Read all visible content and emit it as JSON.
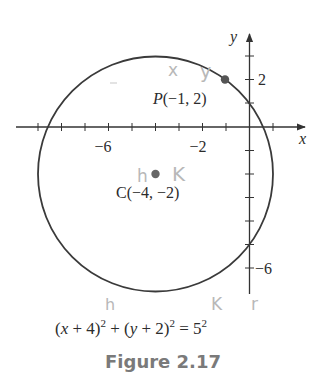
{
  "figure": {
    "caption": "Figure 2.17",
    "equation": {
      "part1": "(",
      "x": "x",
      "part2": " + 4)",
      "exp1": "2",
      "part3": " + (",
      "y": "y",
      "part4": " + 2)",
      "exp2": "2",
      "part5": " = 5",
      "exp3": "2"
    },
    "axes": {
      "x_label": "x",
      "y_label": "y",
      "x_tick_labels": [
        {
          "value": -6,
          "text": "−6"
        },
        {
          "value": -2,
          "text": "−2"
        }
      ],
      "y_tick_labels": [
        {
          "value": 2,
          "text": "2"
        },
        {
          "value": -6,
          "text": "−6"
        }
      ]
    },
    "points": {
      "P": {
        "name": "P",
        "label": "(−1, 2)",
        "x": -1,
        "y": 2
      },
      "C": {
        "name": "C",
        "label": "(−4, −2)",
        "x": -4,
        "y": -2
      }
    },
    "circle": {
      "center_x": -4,
      "center_y": -2,
      "radius": 5
    },
    "handwritten_notes": {
      "near_P_x": "x",
      "near_P_y": "y",
      "near_C_h": "h",
      "near_C_k": "K",
      "eq_h": "h",
      "eq_k": "K",
      "eq_r": "r"
    },
    "colors": {
      "ink": "#3a3a3a",
      "point": "#555555",
      "pencil": "#b8b8b8",
      "caption": "#7a7a7a"
    }
  }
}
